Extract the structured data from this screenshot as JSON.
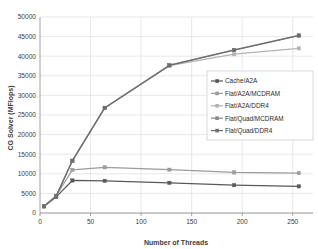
{
  "chart_data": {
    "type": "line",
    "title": "",
    "xlabel": "Number of Threads",
    "ylabel": "CG Solver (MFlops)",
    "xlim": [
      0,
      270
    ],
    "ylim": [
      0,
      50000
    ],
    "xticks": [
      0,
      50,
      100,
      150,
      200,
      250
    ],
    "yticks": [
      0,
      5000,
      10000,
      15000,
      20000,
      25000,
      30000,
      35000,
      40000,
      45000,
      50000
    ],
    "xtick_labels": [
      "0",
      "50",
      "100",
      "150",
      "200",
      "250"
    ],
    "ytick_labels": [
      "0",
      "5000",
      "10000",
      "15000",
      "20000",
      "25000",
      "30000",
      "35000",
      "40000",
      "45000",
      "50000"
    ],
    "grid": true,
    "legend_position": "center-right",
    "x": [
      4,
      16,
      32,
      64,
      128,
      192,
      256
    ],
    "series": [
      {
        "name": "Cache/A2A",
        "color": "#595959",
        "marker": "square",
        "values": [
          1700,
          4100,
          8300,
          8200,
          7700,
          7100,
          6800
        ]
      },
      {
        "name": "Flat/A2A/MCDRAM",
        "color": "#9c9c9c",
        "marker": "square",
        "values": [
          1750,
          4400,
          11000,
          11650,
          11050,
          10350,
          10200
        ]
      },
      {
        "name": "Flat/A2A/DDR4",
        "color": "#b3b3b3",
        "marker": "square",
        "values": [
          1700,
          4300,
          13300,
          26800,
          37600,
          40500,
          42000
        ]
      },
      {
        "name": "Flat/Quad/MCDRAM",
        "color": "#8a8a8a",
        "marker": "square",
        "values": [
          1750,
          4350,
          13350,
          26850,
          37700,
          41600,
          45300
        ]
      },
      {
        "name": "Flat/Quad/DDR4",
        "color": "#6e6e6e",
        "marker": "square",
        "values": [
          1700,
          4250,
          13300,
          26800,
          37650,
          41550,
          45250
        ]
      }
    ]
  },
  "legend": {
    "entries": [
      "Cache/A2A",
      "Flat/A2A/MCDRAM",
      "Flat/A2A/DDR4",
      "Flat/Quad/MCDRAM",
      "Flat/Quad/DDR4"
    ]
  }
}
